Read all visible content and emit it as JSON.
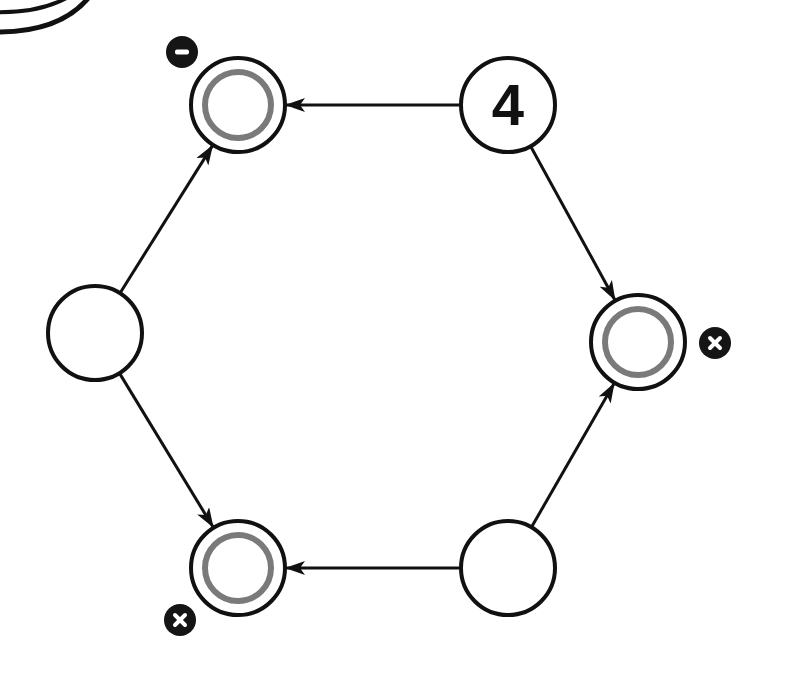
{
  "diagram": {
    "type": "state-graph",
    "colors": {
      "stroke": "#111111",
      "accept_ring": "#7a7a7a",
      "badge": "#151515",
      "background": "#ffffff"
    },
    "nodes": [
      {
        "id": "n4",
        "label": "4",
        "x": 508,
        "y": 105,
        "accept": false,
        "badge": null
      },
      {
        "id": "tl",
        "label": "",
        "x": 238,
        "y": 105,
        "accept": true,
        "badge": {
          "symbol": "−",
          "x": 182,
          "y": 52
        }
      },
      {
        "id": "l",
        "label": "",
        "x": 95,
        "y": 333,
        "accept": false,
        "badge": null
      },
      {
        "id": "r",
        "label": "",
        "x": 638,
        "y": 342,
        "accept": true,
        "badge": {
          "symbol": "×",
          "x": 715,
          "y": 343
        }
      },
      {
        "id": "bl",
        "label": "",
        "x": 238,
        "y": 568,
        "accept": true,
        "badge": {
          "symbol": "×",
          "x": 180,
          "y": 620
        }
      },
      {
        "id": "br",
        "label": "",
        "x": 508,
        "y": 568,
        "accept": false,
        "badge": null
      }
    ],
    "edges": [
      {
        "from": "n4",
        "to": "tl"
      },
      {
        "from": "n4",
        "to": "r"
      },
      {
        "from": "l",
        "to": "tl"
      },
      {
        "from": "l",
        "to": "bl"
      },
      {
        "from": "br",
        "to": "bl"
      },
      {
        "from": "br",
        "to": "r"
      }
    ]
  }
}
